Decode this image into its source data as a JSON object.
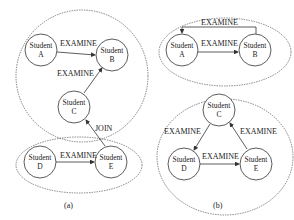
{
  "panels": [
    {
      "caption": "(a)",
      "nodes": [
        {
          "id": "A",
          "line1": "Student",
          "line2": "A"
        },
        {
          "id": "B",
          "line1": "Student",
          "line2": "B"
        },
        {
          "id": "C",
          "line1": "Student",
          "line2": "C"
        },
        {
          "id": "D",
          "line1": "Student",
          "line2": "D"
        },
        {
          "id": "E",
          "line1": "Student",
          "line2": "E"
        }
      ],
      "edges": [
        {
          "from": "A",
          "to": "B",
          "label": "EXAMINE"
        },
        {
          "from": "C",
          "to": "B",
          "label": "EXAMINE"
        },
        {
          "from": "D",
          "to": "E",
          "label": "EXAMINE"
        },
        {
          "from": "E",
          "to": "C",
          "label": "JOIN"
        }
      ],
      "groups": [
        [
          "A",
          "B",
          "C"
        ],
        [
          "D",
          "E"
        ]
      ]
    },
    {
      "caption": "(b)",
      "nodes": [
        {
          "id": "A",
          "line1": "Student",
          "line2": "A"
        },
        {
          "id": "B",
          "line1": "Student",
          "line2": "B"
        },
        {
          "id": "C",
          "line1": "Student",
          "line2": "C"
        },
        {
          "id": "D",
          "line1": "Student",
          "line2": "D"
        },
        {
          "id": "E",
          "line1": "Student",
          "line2": "E"
        }
      ],
      "edges": [
        {
          "from": "A",
          "to": "B",
          "label": "EXAMINE"
        },
        {
          "from": "B",
          "to": "A",
          "label": "EXAMINE"
        },
        {
          "from": "C",
          "to": "D",
          "label": "EXAMINE"
        },
        {
          "from": "D",
          "to": "E",
          "label": "EXAMINE"
        },
        {
          "from": "E",
          "to": "C",
          "label": "EXAMINE"
        }
      ],
      "groups": [
        [
          "A",
          "B"
        ],
        [
          "C",
          "D",
          "E"
        ]
      ]
    }
  ]
}
